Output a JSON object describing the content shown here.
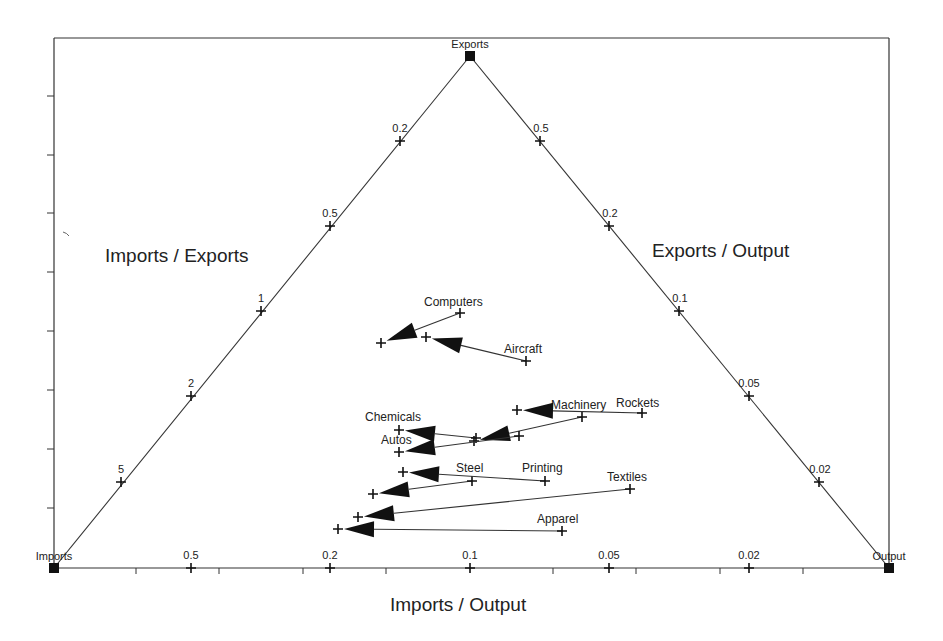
{
  "chart_data": {
    "type": "ternary-trajectory",
    "title": "",
    "vertices": {
      "top": "Exports",
      "bottom_left": "Imports",
      "bottom_right": "Output"
    },
    "axis_labels": {
      "left": "Imports / Exports",
      "right": "Exports / Output",
      "bottom": "Imports / Output"
    },
    "left_edge_ticks": [
      "5",
      "2",
      "1",
      "0.5",
      "0.2"
    ],
    "right_edge_ticks": [
      "0.5",
      "0.2",
      "0.1",
      "0.05",
      "0.02"
    ],
    "bottom_edge_ticks": [
      "0.5",
      "0.2",
      "0.1",
      "0.05",
      "0.02"
    ],
    "industries": [
      {
        "name": "Computers",
        "start": [
          460,
          313
        ],
        "end": [
          381,
          343
        ],
        "label_pos": [
          424,
          306
        ]
      },
      {
        "name": "Aircraft",
        "start": [
          526,
          361
        ],
        "end": [
          426,
          337
        ],
        "label_pos": [
          504,
          353
        ]
      },
      {
        "name": "Machinery",
        "start": [
          582,
          417
        ],
        "end": [
          474,
          441
        ],
        "label_pos": [
          551,
          409
        ]
      },
      {
        "name": "Rockets",
        "start": [
          642,
          413
        ],
        "end": [
          517,
          410
        ],
        "label_pos": [
          616,
          407
        ]
      },
      {
        "name": "Chemicals",
        "start": [
          476,
          438
        ],
        "end": [
          399,
          430
        ],
        "label_pos": [
          365,
          421
        ]
      },
      {
        "name": "Autos",
        "start": [
          519,
          436
        ],
        "end": [
          399,
          452
        ],
        "label_pos": [
          381,
          444
        ]
      },
      {
        "name": "Steel",
        "start": [
          472,
          481
        ],
        "end": [
          373,
          494
        ],
        "label_pos": [
          456,
          472
        ]
      },
      {
        "name": "Printing",
        "start": [
          545,
          481
        ],
        "end": [
          403,
          472
        ],
        "label_pos": [
          522,
          472
        ]
      },
      {
        "name": "Textiles",
        "start": [
          630,
          489
        ],
        "end": [
          358,
          517
        ],
        "label_pos": [
          607,
          481
        ]
      },
      {
        "name": "Apparel",
        "start": [
          562,
          531
        ],
        "end": [
          338,
          529
        ],
        "label_pos": [
          537,
          523
        ]
      }
    ]
  },
  "labels": {
    "imports_exports": "Imports / Exports",
    "exports_output": "Exports / Output",
    "imports_output": "Imports / Output",
    "vertex_top": "Exports",
    "vertex_left": "Imports",
    "vertex_right": "Output"
  },
  "colors": {
    "line": "#333333",
    "marker": "#111111",
    "background": "#ffffff"
  }
}
